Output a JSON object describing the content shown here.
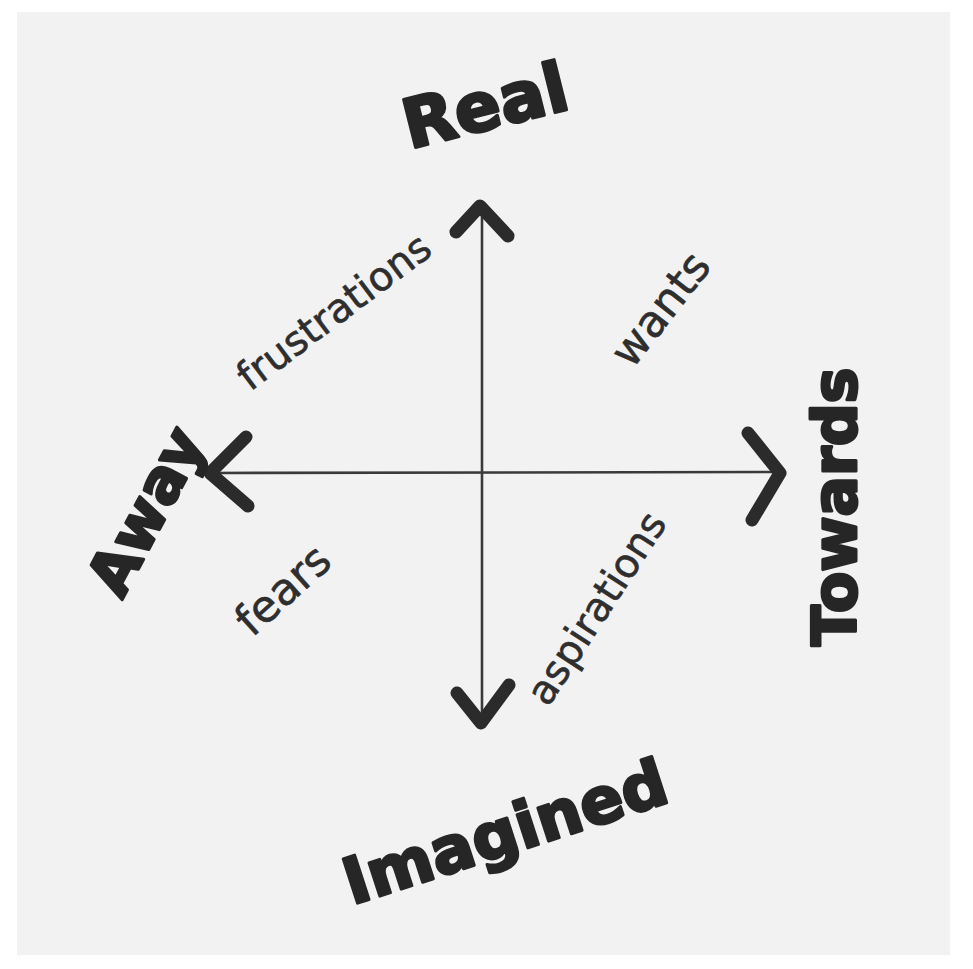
{
  "diagram": {
    "type": "quadrant",
    "colors": {
      "paper": "#f2f2f2",
      "background": "#ffffff",
      "ink": "#262626"
    },
    "axes": {
      "vertical": {
        "top_label": "Real",
        "bottom_label": "Imagined"
      },
      "horizontal": {
        "left_label": "Away",
        "right_label": "Towards"
      }
    },
    "quadrants": {
      "top_left": "frustrations",
      "top_right": "wants",
      "bottom_left": "fears",
      "bottom_right": "aspirations"
    }
  }
}
